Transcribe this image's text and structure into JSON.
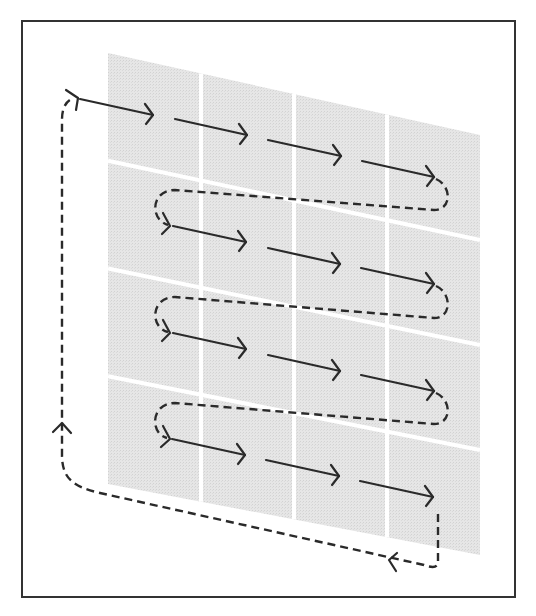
{
  "diagram": {
    "type": "serpentine-scan-path",
    "grid": {
      "rows": 4,
      "cols": 4,
      "corners": {
        "top_left": [
          108,
          53
        ],
        "top_right": [
          480,
          135
        ],
        "bottom_left": [
          108,
          484
        ],
        "bottom_right": [
          480,
          555
        ]
      },
      "fill_color": "#e2e2e2",
      "gap_color": "#ffffff"
    },
    "frame": {
      "stroke_color": "#333333"
    },
    "path": {
      "solid_color": "#2a2a2a",
      "dashed_color": "#2a2a2a",
      "rows": [
        {
          "row": 1,
          "direction": "left-to-right",
          "segments": 4
        },
        {
          "row": 2,
          "direction": "left-to-right",
          "segments": 3
        },
        {
          "row": 3,
          "direction": "left-to-right",
          "segments": 3
        },
        {
          "row": 4,
          "direction": "left-to-right",
          "segments": 3
        }
      ],
      "return_loop": "dashed line from bottom-right back up the left side to the start"
    }
  }
}
